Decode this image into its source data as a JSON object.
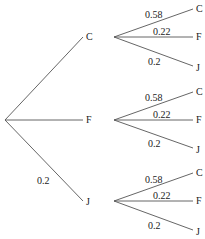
{
  "tree": {
    "root_branches": [
      {
        "node": "C",
        "prob": ""
      },
      {
        "node": "F",
        "prob": ""
      },
      {
        "node": "J",
        "prob": "0.2"
      }
    ],
    "sub_branches": [
      {
        "parent": "C",
        "children": [
          {
            "node": "C",
            "prob": "0.58"
          },
          {
            "node": "F",
            "prob": "0.22"
          },
          {
            "node": "J",
            "prob": "0.2"
          }
        ]
      },
      {
        "parent": "F",
        "children": [
          {
            "node": "C",
            "prob": "0.58"
          },
          {
            "node": "F",
            "prob": "0.22"
          },
          {
            "node": "J",
            "prob": "0.2"
          }
        ]
      },
      {
        "parent": "J",
        "children": [
          {
            "node": "C",
            "prob": "0.58"
          },
          {
            "node": "F",
            "prob": "0.22"
          },
          {
            "node": "J",
            "prob": "0.2"
          }
        ]
      }
    ]
  },
  "colors": {
    "line": "#555555",
    "text": "#222222"
  }
}
